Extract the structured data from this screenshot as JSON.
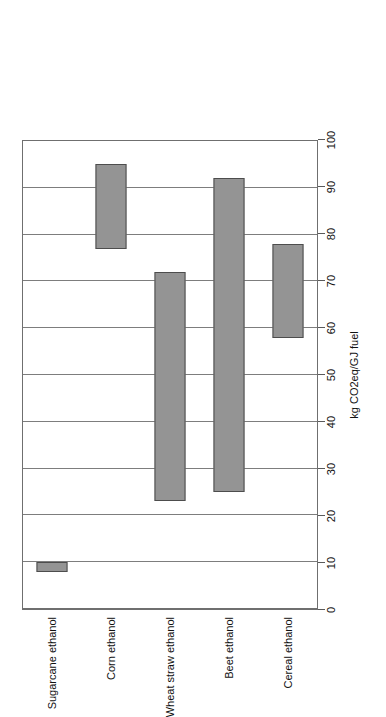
{
  "chart_data": {
    "type": "bar",
    "orientation": "horizontal-ranges",
    "title": "",
    "xlabel": "kg CO2eq/GJ fuel",
    "ylabel": "",
    "xlim": [
      0,
      100
    ],
    "xticks": [
      0,
      10,
      20,
      30,
      40,
      50,
      60,
      70,
      80,
      90,
      100
    ],
    "grid": true,
    "legend": false,
    "bar_color": "#949494",
    "bar_edge_color": "#4d4d4d",
    "categories": [
      "Sugarcane ethanol",
      "Corn ethanol",
      "Wheat straw ethanol",
      "Beet ethanol",
      "Cereal ethanol"
    ],
    "ranges": [
      {
        "category": "Sugarcane ethanol",
        "low": 8,
        "high": 10
      },
      {
        "category": "Corn ethanol",
        "low": 77,
        "high": 95
      },
      {
        "category": "Wheat straw ethanol",
        "low": 23,
        "high": 72
      },
      {
        "category": "Beet ethanol",
        "low": 25,
        "high": 92
      },
      {
        "category": "Cereal ethanol",
        "low": 58,
        "high": 78
      }
    ]
  }
}
